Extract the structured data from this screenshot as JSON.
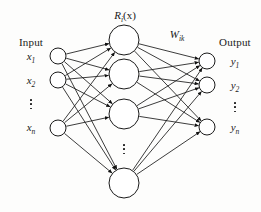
{
  "figure": {
    "type": "neural-network-diagram",
    "title_labels": {
      "hidden_layer_function": "R",
      "hidden_layer_function_sub": "i",
      "hidden_layer_function_arg": "(x)",
      "weights": "W",
      "weights_sub": "ik"
    },
    "input_heading": "Input",
    "output_heading": "Output",
    "input_nodes": [
      {
        "label": "x",
        "sub": "1"
      },
      {
        "label": "x",
        "sub": "2"
      },
      {
        "label": "x",
        "sub": "n"
      }
    ],
    "output_nodes": [
      {
        "label": "y",
        "sub": "1"
      },
      {
        "label": "y",
        "sub": "2"
      },
      {
        "label": "y",
        "sub": "n"
      }
    ],
    "ellipsis_glyph": "vertical-ellipsis",
    "colors": {
      "background": "#fdfdfc",
      "stroke": "#1a1a1a",
      "node_fill": "#ffffff",
      "arrowhead": "#111111"
    }
  },
  "chart_data": {
    "type": "diagram",
    "layers": [
      {
        "name": "input",
        "count_shown": 3,
        "has_ellipsis": true,
        "node_radius": 8,
        "x": 58,
        "node_y": [
          56,
          80,
          128
        ],
        "ellipsis_y": 104
      },
      {
        "name": "hidden",
        "count_shown": 4,
        "has_ellipsis": true,
        "node_radius": 15,
        "x": 124,
        "node_y": [
          40,
          74,
          114,
          183
        ],
        "ellipsis_y": 150
      },
      {
        "name": "output",
        "count_shown": 3,
        "has_ellipsis": true,
        "node_radius": 8,
        "x": 207,
        "node_y": [
          61,
          85,
          127
        ],
        "ellipsis_y": 106
      }
    ],
    "connections": "fully-connected",
    "edge_style": "directed-arrow",
    "direction": "left-to-right"
  }
}
